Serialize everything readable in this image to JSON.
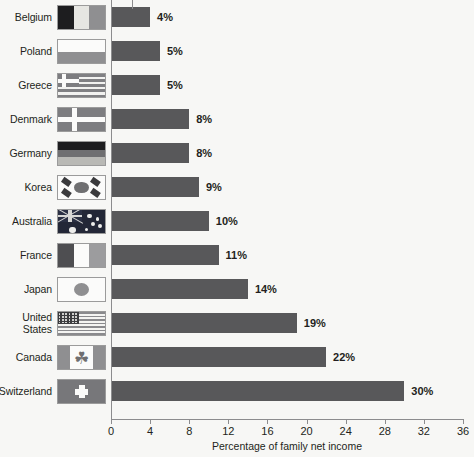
{
  "chart_data": {
    "type": "bar",
    "orientation": "horizontal",
    "title": "",
    "xlabel": "Percentage of family net income",
    "ylabel": "",
    "xlim": [
      0,
      36
    ],
    "xticks": [
      0,
      4,
      8,
      12,
      16,
      20,
      24,
      28,
      32,
      36
    ],
    "grid": false,
    "legend": null,
    "categories": [
      "Belgium",
      "Poland",
      "Greece",
      "Denmark",
      "Germany",
      "Korea",
      "Australia",
      "France",
      "Japan",
      "United States",
      "Canada",
      "Switzerland"
    ],
    "values": [
      4,
      5,
      5,
      8,
      8,
      9,
      10,
      11,
      14,
      19,
      22,
      30
    ],
    "value_labels": [
      "4%",
      "5%",
      "5%",
      "8%",
      "8%",
      "9%",
      "10%",
      "11%",
      "14%",
      "19%",
      "22%",
      "30%"
    ],
    "bar_color": "#58585a",
    "background_color": "#f7f7f5"
  },
  "rows": [
    {
      "country": "Belgium",
      "country_line1": "Belgium",
      "country_line2": "",
      "value": 4,
      "label": "4%",
      "flag": "flag-belgium"
    },
    {
      "country": "Poland",
      "country_line1": "Poland",
      "country_line2": "",
      "value": 5,
      "label": "5%",
      "flag": "flag-poland"
    },
    {
      "country": "Greece",
      "country_line1": "Greece",
      "country_line2": "",
      "value": 5,
      "label": "5%",
      "flag": "flag-greece"
    },
    {
      "country": "Denmark",
      "country_line1": "Denmark",
      "country_line2": "",
      "value": 8,
      "label": "8%",
      "flag": "flag-denmark"
    },
    {
      "country": "Germany",
      "country_line1": "Germany",
      "country_line2": "",
      "value": 8,
      "label": "8%",
      "flag": "flag-germany"
    },
    {
      "country": "Korea",
      "country_line1": "Korea",
      "country_line2": "",
      "value": 9,
      "label": "9%",
      "flag": "flag-korea"
    },
    {
      "country": "Australia",
      "country_line1": "Australia",
      "country_line2": "",
      "value": 10,
      "label": "10%",
      "flag": "flag-australia"
    },
    {
      "country": "France",
      "country_line1": "France",
      "country_line2": "",
      "value": 11,
      "label": "11%",
      "flag": "flag-france"
    },
    {
      "country": "Japan",
      "country_line1": "Japan",
      "country_line2": "",
      "value": 14,
      "label": "14%",
      "flag": "flag-japan"
    },
    {
      "country": "United States",
      "country_line1": "United",
      "country_line2": "States",
      "value": 19,
      "label": "19%",
      "flag": "flag-usa"
    },
    {
      "country": "Canada",
      "country_line1": "Canada",
      "country_line2": "",
      "value": 22,
      "label": "22%",
      "flag": "flag-canada"
    },
    {
      "country": "Switzerland",
      "country_line1": "Switzerland",
      "country_line2": "",
      "value": 30,
      "label": "30%",
      "flag": "flag-switzerland"
    }
  ],
  "axis": {
    "x_title": "Percentage of family net income",
    "ticks": [
      "0",
      "4",
      "8",
      "12",
      "16",
      "20",
      "24",
      "28",
      "32",
      "36"
    ]
  },
  "icons": {
    "maple_leaf": "☘"
  }
}
